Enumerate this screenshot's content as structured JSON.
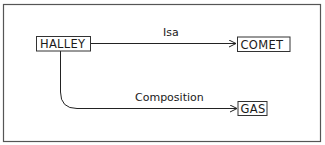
{
  "diagram": {
    "type": "semantic-network",
    "colors": {
      "background": "#ffffff",
      "frame": "#555555",
      "stroke": "#222222",
      "text": "#1a1a1a"
    },
    "nodes": [
      {
        "id": "halley",
        "label": "HALLEY"
      },
      {
        "id": "comet",
        "label": "COMET"
      },
      {
        "id": "gas",
        "label": "GAS"
      }
    ],
    "edges": [
      {
        "from": "halley",
        "to": "comet",
        "label": "Isa"
      },
      {
        "from": "halley",
        "to": "gas",
        "label": "Composition"
      }
    ]
  }
}
